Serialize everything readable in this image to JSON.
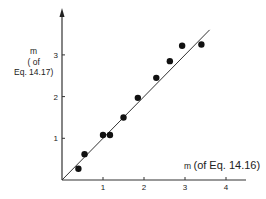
{
  "chart_data": {
    "type": "scatter",
    "title": "",
    "xlabel": "m (of Eq. 14.16)",
    "ylabel": "m (of Eq. 14.17)",
    "xlim": [
      0,
      4.5
    ],
    "ylim": [
      0,
      4.0
    ],
    "x_ticks": [
      1,
      2,
      3,
      4
    ],
    "y_ticks": [
      1,
      2,
      3
    ],
    "grid": false,
    "legend": null,
    "series": [
      {
        "name": "data points",
        "kind": "scatter",
        "x": [
          0.4,
          0.55,
          1.0,
          1.17,
          1.5,
          1.85,
          2.3,
          2.63,
          2.93,
          3.4
        ],
        "y": [
          0.27,
          0.62,
          1.08,
          1.08,
          1.5,
          1.97,
          2.45,
          2.85,
          3.22,
          3.25
        ]
      },
      {
        "name": "fit line (y = x)",
        "kind": "line",
        "x": [
          0,
          3.6
        ],
        "y": [
          0,
          3.6
        ]
      }
    ]
  },
  "labels": {
    "y_axis": {
      "line1": "m",
      "line2": "( of",
      "line3": "Eq. 14.17)"
    },
    "x_axis": {
      "symbol": "m",
      "text": "(of Eq. 14.16)"
    },
    "x_tick_labels": [
      "1",
      "2",
      "3",
      "4"
    ],
    "y_tick_labels": [
      "1",
      "2",
      "3"
    ]
  }
}
